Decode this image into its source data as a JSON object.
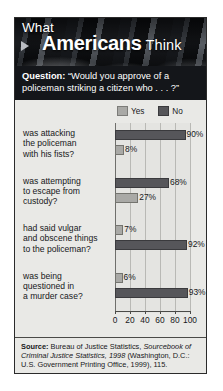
{
  "masthead": {
    "line1": "What",
    "line2_bold": "Americans",
    "line2_light": "Think",
    "arrow_icon": "triangle-right-icon"
  },
  "question": {
    "label": "Question:",
    "text": "“Would you approve of a policeman striking a citizen who . . . ?”"
  },
  "legend": {
    "yes_label": "Yes",
    "no_label": "No",
    "yes_color": "#a9a9a6",
    "no_color": "#56565a"
  },
  "source": {
    "label": "Source:",
    "part1": " Bureau of Justice Statistics, ",
    "italic1": "Sourcebook of Criminal Justice Statistics, 1998",
    "part2": " (Washington, D.C.: U.S. Government Printing Office, 1999), 115."
  },
  "chart_data": {
    "type": "bar",
    "orientation": "horizontal",
    "subtitle": "Question: “Would you approve of a policeman striking a citizen who . . . ?”",
    "xlabel": "",
    "ylabel": "",
    "xlim": [
      0,
      100
    ],
    "xticks": [
      0,
      20,
      40,
      60,
      80,
      100
    ],
    "xticklabels": [
      "0",
      "20",
      "40",
      "60",
      "80",
      "100"
    ],
    "grid": true,
    "grid_axis": "x",
    "legend_position": "top",
    "legend": [
      "Yes",
      "No"
    ],
    "categories": [
      "was attacking the policeman with his fists?",
      "was attempting to escape from custody?",
      "had said vulgar and obscene things to the policeman?",
      "was being questioned in a murder case?"
    ],
    "series": [
      {
        "name": "Yes",
        "color": "#a9a9a6",
        "values": [
          8,
          27,
          7,
          6
        ]
      },
      {
        "name": "No",
        "color": "#56565a",
        "values": [
          90,
          68,
          92,
          93
        ]
      }
    ],
    "groups": [
      {
        "category_lines": [
          "was attacking",
          "the policeman",
          "with his fists?"
        ],
        "bars": [
          {
            "series": "No",
            "value": 90,
            "value_label": "90%",
            "order": 0
          },
          {
            "series": "Yes",
            "value": 8,
            "value_label": "8%",
            "order": 1
          }
        ]
      },
      {
        "category_lines": [
          "was attempting",
          "to escape from",
          "custody?"
        ],
        "bars": [
          {
            "series": "No",
            "value": 68,
            "value_label": "68%",
            "order": 0
          },
          {
            "series": "Yes",
            "value": 27,
            "value_label": "27%",
            "order": 1
          }
        ]
      },
      {
        "category_lines": [
          "had said vulgar",
          "and obscene things",
          "to the policeman?"
        ],
        "bars": [
          {
            "series": "Yes",
            "value": 7,
            "value_label": "7%",
            "order": 0
          },
          {
            "series": "No",
            "value": 92,
            "value_label": "92%",
            "order": 1
          }
        ]
      },
      {
        "category_lines": [
          "was being",
          "questioned in",
          "a murder case?"
        ],
        "bars": [
          {
            "series": "Yes",
            "value": 6,
            "value_label": "6%",
            "order": 0
          },
          {
            "series": "No",
            "value": 93,
            "value_label": "93%",
            "order": 1
          }
        ]
      }
    ]
  }
}
